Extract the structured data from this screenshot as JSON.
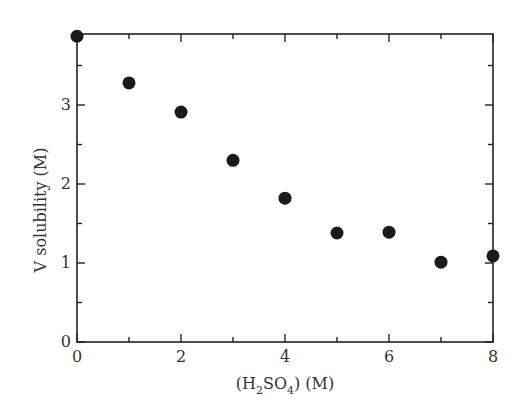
{
  "chart_data": {
    "type": "scatter",
    "title": "",
    "xlabel": "(H2SO4) (M)",
    "xlabel_parts": {
      "pre": "(H",
      "sub1": "2",
      "mid": "SO",
      "sub2": "4",
      "post": ") (M)"
    },
    "ylabel": "V solubility (M)",
    "xlim": [
      0,
      8
    ],
    "ylim": [
      0,
      3.9
    ],
    "x_ticks": [
      0,
      2,
      4,
      6,
      8
    ],
    "x_tick_labels": [
      "0",
      "2",
      "4",
      "6",
      "8"
    ],
    "x_minor_ticks": [
      1,
      3,
      5,
      7
    ],
    "y_ticks": [
      0,
      1,
      2,
      3
    ],
    "y_tick_labels": [
      "0",
      "1",
      "2",
      "3"
    ],
    "y_minor_ticks": [
      0.5,
      1.5,
      2.5,
      3.5
    ],
    "grid": false,
    "legend": null,
    "marker_color": "#1a1a1a",
    "series": [
      {
        "name": "V solubility",
        "x": [
          0,
          1,
          2,
          3,
          4,
          5,
          6,
          7,
          8
        ],
        "y": [
          3.87,
          3.28,
          2.91,
          2.3,
          1.82,
          1.38,
          1.39,
          1.01,
          1.09
        ]
      }
    ]
  }
}
